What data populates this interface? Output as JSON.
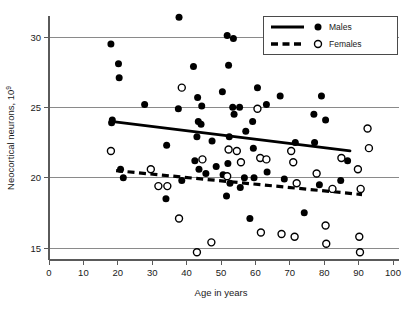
{
  "chart_data": {
    "type": "scatter",
    "title": "",
    "xlabel": "Age in years",
    "ylabel": "Neocortical neurons, 10",
    "ylabel_sup": "9",
    "xlim": [
      0,
      100
    ],
    "ylim": [
      14.2,
      31.5
    ],
    "xticks": [
      0,
      10,
      20,
      30,
      40,
      50,
      60,
      70,
      80,
      90,
      100
    ],
    "yticks": [
      15,
      20,
      25,
      30
    ],
    "xtick_labels": [
      "0",
      "10",
      "20",
      "30",
      "40",
      "50",
      "60",
      "70",
      "80",
      "90",
      "100"
    ],
    "ytick_labels": [
      "15",
      "20",
      "25",
      "30"
    ],
    "grid": "horizontal",
    "grid_color": "#8a8a8a",
    "legend_position": "top-right",
    "legend": [
      {
        "label": "Males",
        "marker": "filled-circle",
        "line": "solid",
        "color": "#000000"
      },
      {
        "label": "Females",
        "marker": "open-circle",
        "line": "dashed",
        "color": "#000000"
      }
    ],
    "series": [
      {
        "name": "Males",
        "marker": "filled-circle",
        "color": "#000000",
        "points": [
          [
            18.0,
            29.5
          ],
          [
            18.2,
            23.9
          ],
          [
            18.4,
            24.1
          ],
          [
            20.2,
            28.1
          ],
          [
            20.4,
            27.1
          ],
          [
            20.8,
            20.6
          ],
          [
            21.6,
            20.0
          ],
          [
            27.8,
            25.2
          ],
          [
            34.0,
            18.5
          ],
          [
            34.2,
            22.3
          ],
          [
            37.6,
            24.9
          ],
          [
            37.8,
            31.4
          ],
          [
            38.6,
            19.8
          ],
          [
            42.0,
            27.9
          ],
          [
            42.4,
            21.2
          ],
          [
            43.0,
            22.9
          ],
          [
            43.2,
            25.7
          ],
          [
            43.4,
            24.0
          ],
          [
            43.6,
            20.6
          ],
          [
            44.2,
            23.8
          ],
          [
            44.4,
            25.1
          ],
          [
            45.6,
            20.3
          ],
          [
            47.4,
            22.6
          ],
          [
            48.6,
            20.8
          ],
          [
            50.4,
            26.1
          ],
          [
            50.6,
            20.2
          ],
          [
            51.6,
            18.7
          ],
          [
            51.8,
            30.1
          ],
          [
            52.0,
            21.0
          ],
          [
            52.2,
            28.0
          ],
          [
            52.4,
            22.9
          ],
          [
            52.6,
            19.6
          ],
          [
            53.4,
            25.0
          ],
          [
            53.6,
            29.9
          ],
          [
            53.8,
            24.5
          ],
          [
            55.4,
            25.0
          ],
          [
            55.6,
            19.3
          ],
          [
            56.8,
            20.0
          ],
          [
            57.2,
            23.3
          ],
          [
            58.4,
            17.1
          ],
          [
            59.2,
            24.0
          ],
          [
            59.4,
            22.1
          ],
          [
            59.6,
            20.0
          ],
          [
            60.6,
            26.4
          ],
          [
            63.2,
            25.2
          ],
          [
            63.4,
            20.4
          ],
          [
            67.2,
            25.8
          ],
          [
            68.4,
            19.9
          ],
          [
            71.6,
            22.5
          ],
          [
            74.2,
            17.5
          ],
          [
            77.0,
            24.5
          ],
          [
            77.2,
            22.5
          ],
          [
            78.6,
            19.5
          ],
          [
            79.2,
            25.8
          ],
          [
            80.4,
            24.1
          ],
          [
            84.8,
            19.8
          ],
          [
            86.8,
            21.2
          ]
        ],
        "trend": {
          "x1": 18.0,
          "y1": 24.0,
          "x2": 87.5,
          "y2": 21.9,
          "style": "solid"
        }
      },
      {
        "name": "Females",
        "marker": "open-circle",
        "color": "#000000",
        "points": [
          [
            18.0,
            21.9
          ],
          [
            29.6,
            20.6
          ],
          [
            31.8,
            19.4
          ],
          [
            34.4,
            19.4
          ],
          [
            37.8,
            17.1
          ],
          [
            38.6,
            26.4
          ],
          [
            43.0,
            14.7
          ],
          [
            44.6,
            21.3
          ],
          [
            47.2,
            15.4
          ],
          [
            51.8,
            20.1
          ],
          [
            52.2,
            22.0
          ],
          [
            54.6,
            21.9
          ],
          [
            55.8,
            21.1
          ],
          [
            60.6,
            24.9
          ],
          [
            61.4,
            21.4
          ],
          [
            61.6,
            16.1
          ],
          [
            63.2,
            21.3
          ],
          [
            67.6,
            16.0
          ],
          [
            70.4,
            21.9
          ],
          [
            71.0,
            21.1
          ],
          [
            71.4,
            15.8
          ],
          [
            72.0,
            19.6
          ],
          [
            77.8,
            20.3
          ],
          [
            80.4,
            16.6
          ],
          [
            80.6,
            15.3
          ],
          [
            82.4,
            19.2
          ],
          [
            85.0,
            21.4
          ],
          [
            89.8,
            20.6
          ],
          [
            90.2,
            15.8
          ],
          [
            90.4,
            14.7
          ],
          [
            90.6,
            19.2
          ],
          [
            92.6,
            23.5
          ],
          [
            93.0,
            22.1
          ]
        ],
        "trend": {
          "x1": 19.5,
          "y1": 20.5,
          "x2": 91.0,
          "y2": 18.8,
          "style": "dashed"
        }
      }
    ]
  }
}
